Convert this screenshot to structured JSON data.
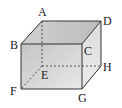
{
  "diagram": {
    "type": "cuboid",
    "vertices": {
      "A": {
        "label": "A"
      },
      "B": {
        "label": "B"
      },
      "C": {
        "label": "C"
      },
      "D": {
        "label": "D"
      },
      "E": {
        "label": "E"
      },
      "F": {
        "label": "F"
      },
      "G": {
        "label": "G"
      },
      "H": {
        "label": "H"
      }
    },
    "hidden_edges": [
      "AE",
      "EF",
      "EH"
    ],
    "colors": {
      "edge": "#333333",
      "front_face": "#d6d6d6",
      "top_face": "#c8c8c8",
      "side_face": "#e2e2e2"
    }
  }
}
